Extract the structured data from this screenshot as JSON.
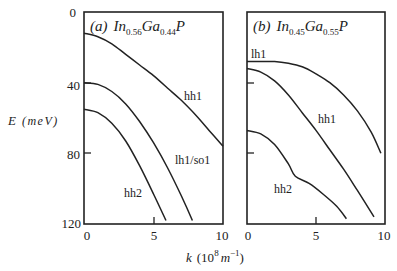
{
  "chart_data": [
    {
      "type": "line",
      "panel": "a",
      "title": "(a) In0.56Ga0.44P",
      "title_parts": {
        "prefix": "(a)",
        "el1": "In",
        "sub1": "0.56",
        "el2": "Ga",
        "sub2": "0.44",
        "el3": "P"
      },
      "xlabel": "k (10^8 m^-1)",
      "ylabel": "E (meV)",
      "xlim": [
        0,
        10
      ],
      "ylim": [
        120,
        0
      ],
      "xticks": [
        "0",
        "5",
        "10"
      ],
      "yticks": [
        "0",
        "40",
        "80",
        "120"
      ],
      "grid": false,
      "series": [
        {
          "name": "hh1",
          "x": [
            0,
            1,
            2,
            3,
            4,
            5,
            6,
            7,
            8,
            9,
            10
          ],
          "y": [
            12,
            14,
            18,
            24,
            30,
            36,
            43,
            50,
            58,
            67,
            76
          ]
        },
        {
          "name": "lh1/so1",
          "x": [
            0,
            1,
            2,
            3,
            4,
            5,
            6,
            7,
            7.8
          ],
          "y": [
            40,
            41,
            45,
            52,
            62,
            74,
            88,
            104,
            118
          ]
        },
        {
          "name": "hh2",
          "x": [
            0,
            1,
            2,
            3,
            4,
            5,
            5.9
          ],
          "y": [
            55,
            57,
            63,
            73,
            87,
            103,
            118
          ]
        }
      ],
      "labels": [
        {
          "text": "hh1",
          "k": 7.6,
          "E": 48
        },
        {
          "text": "lh1/so1",
          "k": 6.8,
          "E": 87
        },
        {
          "text": "hh2",
          "k": 2.9,
          "E": 105
        }
      ]
    },
    {
      "type": "line",
      "panel": "b",
      "title": "(b) In0.45Ga0.55P",
      "title_parts": {
        "prefix": "(b)",
        "el1": "In",
        "sub1": "0.45",
        "el2": "Ga",
        "sub2": "0.55",
        "el3": "P"
      },
      "xlabel": "k (10^8 m^-1)",
      "ylabel": "E (meV)",
      "xlim": [
        0,
        10
      ],
      "ylim": [
        120,
        0
      ],
      "xticks": [
        "0",
        "5",
        "10"
      ],
      "yticks": [],
      "grid": false,
      "series": [
        {
          "name": "lh1",
          "x": [
            0,
            1,
            2,
            3,
            4,
            5,
            6,
            7,
            8,
            9,
            9.7
          ],
          "y": [
            28,
            28,
            28,
            29,
            31,
            35,
            40,
            47,
            56,
            68,
            80
          ]
        },
        {
          "name": "hh1",
          "x": [
            0,
            1,
            2,
            3,
            4,
            5,
            6,
            7,
            8,
            9.2
          ],
          "y": [
            32,
            34,
            39,
            47,
            57,
            67,
            78,
            89,
            101,
            116
          ]
        },
        {
          "name": "hh2",
          "x": [
            0,
            1,
            2,
            3,
            3.5,
            4.5,
            5.5,
            6.5,
            7.2
          ],
          "y": [
            67,
            69,
            75,
            86,
            93,
            97,
            103,
            110,
            117
          ]
        }
      ],
      "labels": [
        {
          "text": "lh1",
          "k": 0.3,
          "E": 24
        },
        {
          "text": "hh1",
          "k": 3.4,
          "E": 56
        },
        {
          "text": "hh2",
          "k": 1.3,
          "E": 97
        }
      ]
    }
  ],
  "axes": {
    "ylabel": "E",
    "yunit": "(meV)",
    "xlabel_k": "k",
    "xlabel_unit_open": "(10",
    "xlabel_exp": "8",
    "xlabel_m": "m",
    "xlabel_mexp": "−1",
    "xlabel_close": ")"
  },
  "ticks": {
    "y": [
      "0",
      "40",
      "80",
      "120"
    ],
    "xa": [
      "0",
      "5",
      "10"
    ],
    "xb": [
      "0",
      "5",
      "10"
    ]
  },
  "panel_a": {
    "prefix": "(a)",
    "el1": "In",
    "sub1": "0.56",
    "el2": "Ga",
    "sub2": "0.44",
    "el3": "P",
    "labels": [
      "hh1",
      "lh1/so1",
      "hh2"
    ]
  },
  "panel_b": {
    "prefix": "(b)",
    "el1": "In",
    "sub1": "0.45",
    "el2": "Ga",
    "sub2": "0.55",
    "el3": "P",
    "labels": [
      "lh1",
      "hh1",
      "hh2"
    ]
  },
  "colors": {
    "line": "#222222",
    "background": "#ffffff"
  }
}
